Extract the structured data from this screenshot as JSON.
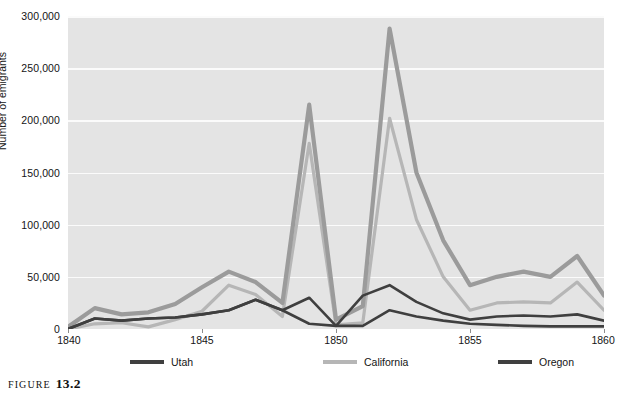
{
  "figure": {
    "caption_word": "FIGURE",
    "caption_number": "13.2"
  },
  "chart_data": {
    "type": "line",
    "title": "",
    "xlabel": "",
    "ylabel": "Number of emigrants",
    "xlim": [
      1840,
      1860
    ],
    "ylim": [
      0,
      300000
    ],
    "grid": true,
    "legend_position": "bottom",
    "x": [
      1840,
      1841,
      1842,
      1843,
      1844,
      1845,
      1846,
      1847,
      1848,
      1849,
      1850,
      1851,
      1852,
      1853,
      1854,
      1855,
      1856,
      1857,
      1858,
      1859,
      1860
    ],
    "x_ticks": [
      1840,
      1845,
      1850,
      1855,
      1860
    ],
    "x_tick_labels": [
      "1840",
      "1845",
      "1850",
      "1855",
      "1860"
    ],
    "y_ticks": [
      0,
      50000,
      100000,
      150000,
      200000,
      250000,
      300000
    ],
    "y_tick_labels": [
      "0",
      "50,000",
      "100,000",
      "150,000",
      "200,000",
      "250,000",
      "300,000"
    ],
    "series": [
      {
        "name": "Utah",
        "color": "#3f3f3f",
        "values": [
          0,
          10000,
          8000,
          10000,
          11000,
          14000,
          18000,
          28000,
          18000,
          5000,
          3000,
          3000,
          18000,
          12000,
          8000,
          5000,
          4000,
          3000,
          2500,
          2500,
          2500
        ]
      },
      {
        "name": "California",
        "color": "#b6b6b6",
        "values": [
          0,
          5000,
          6000,
          2000,
          9000,
          17000,
          42000,
          33000,
          12000,
          178000,
          4000,
          6000,
          202000,
          105000,
          50000,
          18000,
          25000,
          26000,
          25000,
          45000,
          18000
        ]
      },
      {
        "name": "Oregon",
        "color": "#3f3f3f",
        "values": [
          0,
          10000,
          8000,
          10000,
          11000,
          14000,
          18000,
          28000,
          18000,
          30000,
          3000,
          32000,
          42000,
          26000,
          15000,
          9000,
          12000,
          13000,
          12000,
          14000,
          8000
        ]
      },
      {
        "name": "Total",
        "color": "#9b9b9b",
        "values": [
          2000,
          20000,
          14000,
          16000,
          24000,
          40000,
          55000,
          45000,
          25000,
          215000,
          9000,
          22000,
          288000,
          150000,
          85000,
          42000,
          50000,
          55000,
          50000,
          70000,
          32000
        ]
      }
    ]
  },
  "legend": {
    "items": [
      {
        "label": "Utah",
        "color": "#3f3f3f"
      },
      {
        "label": "California",
        "color": "#b6b6b6"
      },
      {
        "label": "Oregon",
        "color": "#3f3f3f"
      },
      {
        "label": "Total",
        "color": "#9b9b9b"
      }
    ]
  }
}
